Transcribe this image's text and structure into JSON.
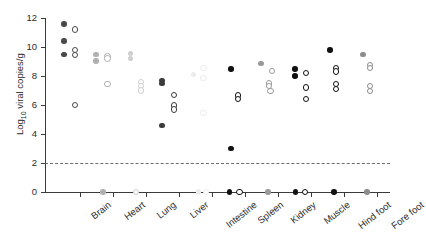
{
  "chart_data": {
    "type": "scatter",
    "title": "",
    "xlabel": "",
    "ylabel": "Log10 viral copies/g",
    "ylabel_prefix": "Log",
    "ylabel_sub": "10",
    "ylabel_suffix": " viral copies/g",
    "ylim": [
      0,
      12
    ],
    "yticks": [
      0,
      2,
      4,
      6,
      8,
      10,
      12
    ],
    "ytick_labels": [
      "0",
      "2",
      "4",
      "6",
      "8",
      "10",
      "12"
    ],
    "grid": false,
    "legend": "none",
    "categories": [
      "Brain",
      "Heart",
      "Lung",
      "Liver",
      "Intestine",
      "Spleen",
      "Kidney",
      "Muscle",
      "Hind foot",
      "Fore foot"
    ],
    "annotations": [
      {
        "name": "detection-threshold",
        "type": "dashed-hline",
        "y": 2.0,
        "color": "#6b6b6b"
      }
    ],
    "series": [
      {
        "name": "Brain",
        "category": "Brain",
        "points": [
          {
            "y": 11.6,
            "style": "filled",
            "color": "#4a4a4a",
            "offset": -0.18
          },
          {
            "y": 10.4,
            "style": "filled",
            "color": "#4a4a4a",
            "offset": -0.18
          },
          {
            "y": 9.5,
            "style": "filled",
            "color": "#4a4a4a",
            "offset": -0.18
          },
          {
            "y": 11.2,
            "style": "open",
            "color": "#4a4a4a",
            "offset": 0.16
          },
          {
            "y": 9.8,
            "style": "open",
            "color": "#4a4a4a",
            "offset": 0.16
          },
          {
            "y": 9.45,
            "style": "open",
            "color": "#4a4a4a",
            "offset": 0.16
          },
          {
            "y": 6.0,
            "style": "open",
            "color": "#4a4a4a",
            "offset": 0.16
          }
        ]
      },
      {
        "name": "Heart",
        "category": "Heart",
        "points": [
          {
            "y": 9.5,
            "style": "filled",
            "color": "#b0b0b0",
            "offset": -0.2
          },
          {
            "y": 9.05,
            "style": "filled",
            "color": "#b0b0b0",
            "offset": -0.2
          },
          {
            "y": 9.35,
            "style": "open",
            "color": "#b0b0b0",
            "offset": 0.14
          },
          {
            "y": 9.2,
            "style": "open",
            "color": "#b0b0b0",
            "offset": 0.14
          },
          {
            "y": 7.45,
            "style": "open",
            "color": "#b0b0b0",
            "offset": 0.14
          },
          {
            "y": 0.0,
            "style": "filled",
            "color": "#b0b0b0",
            "offset": 0.0
          }
        ]
      },
      {
        "name": "Lung",
        "category": "Lung",
        "points": [
          {
            "y": 9.55,
            "style": "filled",
            "color": "#cfcfcf",
            "offset": -0.16
          },
          {
            "y": 9.2,
            "style": "filled",
            "color": "#cfcfcf",
            "offset": -0.16
          },
          {
            "y": 7.6,
            "style": "open",
            "color": "#cfcfcf",
            "offset": 0.16
          },
          {
            "y": 7.3,
            "style": "open",
            "color": "#cfcfcf",
            "offset": 0.16
          },
          {
            "y": 7.0,
            "style": "open",
            "color": "#cfcfcf",
            "offset": 0.16
          },
          {
            "y": 0.0,
            "style": "open",
            "color": "#cfcfcf",
            "offset": 0.0
          }
        ]
      },
      {
        "name": "Liver",
        "category": "Liver",
        "points": [
          {
            "y": 7.7,
            "style": "filled",
            "color": "#3c3c3c",
            "offset": -0.2
          },
          {
            "y": 7.5,
            "style": "filled",
            "color": "#3c3c3c",
            "offset": -0.2
          },
          {
            "y": 4.6,
            "style": "filled",
            "color": "#3c3c3c",
            "offset": -0.2
          },
          {
            "y": 6.7,
            "style": "open",
            "color": "#3c3c3c",
            "offset": 0.16
          },
          {
            "y": 5.95,
            "style": "open",
            "color": "#3c3c3c",
            "offset": 0.16
          },
          {
            "y": 5.7,
            "style": "open",
            "color": "#3c3c3c",
            "offset": 0.16
          }
        ]
      },
      {
        "name": "Intestine",
        "category": "Intestine",
        "points": [
          {
            "y": 8.55,
            "style": "open",
            "color": "#ececec",
            "offset": 0.05
          },
          {
            "y": 7.85,
            "style": "open",
            "color": "#ececec",
            "offset": 0.05
          },
          {
            "y": 8.1,
            "style": "filled",
            "color": "#ececec",
            "offset": -0.25
          },
          {
            "y": 5.45,
            "style": "open",
            "color": "#ececec",
            "offset": 0.05
          },
          {
            "y": 0.0,
            "style": "filled",
            "color": "#ececec",
            "offset": -0.1
          },
          {
            "y": 0.0,
            "style": "open",
            "color": "#ececec",
            "offset": 0.12
          }
        ]
      },
      {
        "name": "Spleen",
        "category": "Spleen",
        "points": [
          {
            "y": 8.5,
            "style": "filled",
            "color": "#111111",
            "offset": -0.12
          },
          {
            "y": 6.65,
            "style": "open",
            "color": "#111111",
            "offset": 0.1
          },
          {
            "y": 6.4,
            "style": "open",
            "color": "#111111",
            "offset": 0.1
          },
          {
            "y": 3.0,
            "style": "filled",
            "color": "#111111",
            "offset": -0.12
          },
          {
            "y": 0.0,
            "style": "filled",
            "color": "#111111",
            "offset": -0.16
          },
          {
            "y": 0.0,
            "style": "open",
            "color": "#111111",
            "offset": 0.14
          }
        ]
      },
      {
        "name": "Kidney",
        "category": "Kidney",
        "points": [
          {
            "y": 8.85,
            "style": "filled",
            "color": "#9a9a9a",
            "offset": -0.2
          },
          {
            "y": 8.35,
            "style": "open",
            "color": "#9a9a9a",
            "offset": 0.12
          },
          {
            "y": 7.5,
            "style": "open",
            "color": "#9a9a9a",
            "offset": 0.04
          },
          {
            "y": 7.3,
            "style": "open",
            "color": "#9a9a9a",
            "offset": 0.04
          },
          {
            "y": 6.95,
            "style": "open",
            "color": "#9a9a9a",
            "offset": 0.08
          },
          {
            "y": 0.0,
            "style": "filled",
            "color": "#9a9a9a",
            "offset": 0.0
          }
        ]
      },
      {
        "name": "Muscle",
        "category": "Muscle",
        "points": [
          {
            "y": 8.5,
            "style": "filled",
            "color": "#111111",
            "offset": -0.18
          },
          {
            "y": 8.0,
            "style": "filled",
            "color": "#111111",
            "offset": -0.18
          },
          {
            "y": 8.2,
            "style": "open",
            "color": "#111111",
            "offset": 0.16
          },
          {
            "y": 7.2,
            "style": "open",
            "color": "#111111",
            "offset": 0.16
          },
          {
            "y": 6.4,
            "style": "open",
            "color": "#111111",
            "offset": 0.16
          },
          {
            "y": 0.0,
            "style": "filled",
            "color": "#111111",
            "offset": -0.16
          },
          {
            "y": 0.0,
            "style": "open",
            "color": "#111111",
            "offset": 0.13
          }
        ]
      },
      {
        "name": "Hind foot",
        "category": "Hind foot",
        "points": [
          {
            "y": 9.8,
            "style": "filled",
            "color": "#111111",
            "offset": -0.12
          },
          {
            "y": 8.55,
            "style": "open",
            "color": "#111111",
            "offset": 0.06
          },
          {
            "y": 8.3,
            "style": "open",
            "color": "#111111",
            "offset": 0.06
          },
          {
            "y": 7.45,
            "style": "open",
            "color": "#111111",
            "offset": 0.06
          },
          {
            "y": 7.1,
            "style": "open",
            "color": "#111111",
            "offset": 0.06
          },
          {
            "y": 0.0,
            "style": "filled",
            "color": "#111111",
            "offset": 0.0
          }
        ]
      },
      {
        "name": "Fore foot",
        "category": "Fore foot",
        "points": [
          {
            "y": 9.5,
            "style": "filled",
            "color": "#8c8c8c",
            "offset": -0.12
          },
          {
            "y": 8.75,
            "style": "open",
            "color": "#8c8c8c",
            "offset": 0.1
          },
          {
            "y": 8.55,
            "style": "open",
            "color": "#8c8c8c",
            "offset": 0.1
          },
          {
            "y": 7.3,
            "style": "open",
            "color": "#8c8c8c",
            "offset": 0.1
          },
          {
            "y": 6.95,
            "style": "open",
            "color": "#8c8c8c",
            "offset": 0.1
          },
          {
            "y": 0.0,
            "style": "filled",
            "color": "#8c8c8c",
            "offset": 0.0
          }
        ]
      }
    ]
  }
}
